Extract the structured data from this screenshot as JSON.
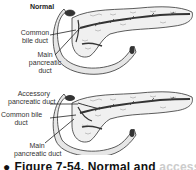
{
  "figure": {
    "panels": [
      {
        "title": "Normal",
        "labels": [
          "Common\nbile duct",
          "Main\npancreatic\nduct"
        ],
        "label_lines": {
          "common_bile_duct": [
            "Common",
            "bile duct"
          ],
          "main_pancreatic_duct": [
            "Main",
            "pancreatic",
            "duct"
          ]
        }
      },
      {
        "title": "",
        "label_lines": {
          "accessory_pancreatic_duct": [
            "Accessory",
            "pancreatic duct"
          ],
          "common_bile_duct": [
            "Common bile",
            "duct"
          ],
          "main_pancreatic_duct": [
            "Main",
            "pancreatic duct"
          ]
        }
      }
    ],
    "caption": {
      "bullet": "●",
      "text": "Figure 7-54. Normal and",
      "clipped_rest": "accessory"
    }
  }
}
